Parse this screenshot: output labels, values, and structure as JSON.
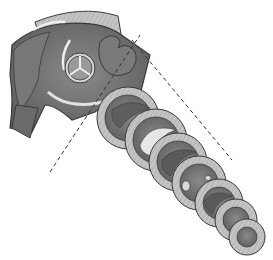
{
  "diagram": {
    "colors": {
      "background": "#ffffff",
      "muscle_dark": "#6b6b6b",
      "muscle_mid": "#858585",
      "wall_light": "#c4c4c4",
      "outline": "#3a3a3a",
      "lumen_light": "#e2e2e2",
      "guide_line": "#333333"
    },
    "sections": [
      {
        "cx": 128,
        "cy": 118,
        "r": 31
      },
      {
        "cx": 156,
        "cy": 140,
        "r": 31
      },
      {
        "cx": 178,
        "cy": 162,
        "r": 29
      },
      {
        "cx": 199,
        "cy": 183,
        "r": 27
      },
      {
        "cx": 219,
        "cy": 203,
        "r": 24
      },
      {
        "cx": 236,
        "cy": 220,
        "r": 21
      },
      {
        "cx": 247,
        "cy": 237,
        "r": 18
      }
    ]
  }
}
